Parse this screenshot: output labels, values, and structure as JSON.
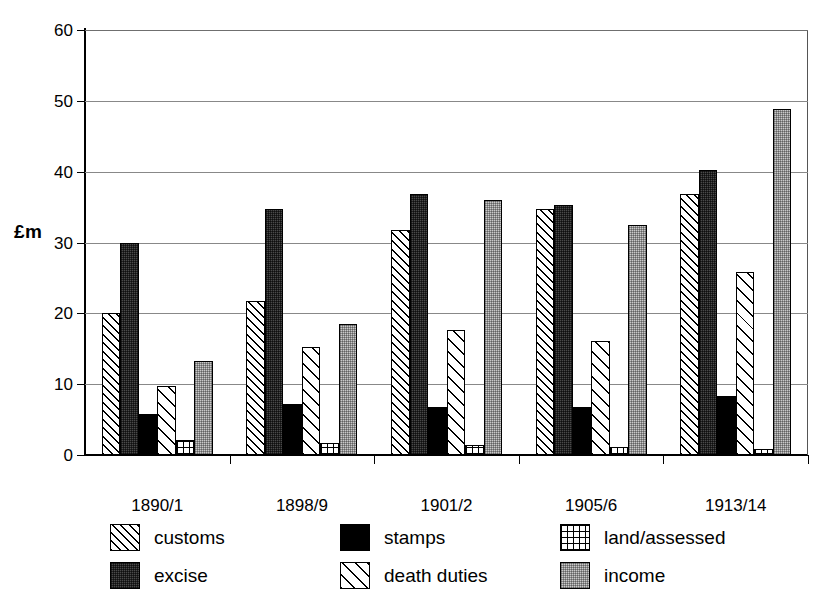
{
  "chart_data": {
    "type": "bar",
    "title": "",
    "xlabel": "",
    "ylabel": "£m",
    "ylim": [
      0,
      60
    ],
    "yticks": [
      0,
      10,
      20,
      30,
      40,
      50,
      60
    ],
    "grid": true,
    "legend_position": "bottom",
    "categories": [
      "1890/1",
      "1898/9",
      "1901/2",
      "1905/6",
      "1913/14"
    ],
    "series": [
      {
        "name": "customs",
        "pattern": "diagonal-hatch-dense",
        "values": [
          20.1,
          21.8,
          31.7,
          34.8,
          36.9
        ]
      },
      {
        "name": "excise",
        "pattern": "dark-checker",
        "values": [
          29.9,
          34.8,
          36.8,
          35.3,
          40.2
        ]
      },
      {
        "name": "stamps",
        "pattern": "solid-black",
        "values": [
          5.8,
          7.2,
          6.8,
          6.8,
          8.3
        ]
      },
      {
        "name": "death duties",
        "pattern": "diagonal-hatch-wide",
        "values": [
          9.8,
          15.3,
          17.7,
          16.1,
          25.9
        ]
      },
      {
        "name": "land/assessed",
        "pattern": "dotted-grid",
        "values": [
          2.1,
          1.7,
          1.4,
          1.1,
          0.8
        ]
      },
      {
        "name": "income",
        "pattern": "light-checker",
        "values": [
          13.3,
          18.5,
          36.0,
          32.5,
          48.8
        ]
      }
    ]
  },
  "axis": {
    "y_title": "£m",
    "y_tick_labels": [
      "0",
      "10",
      "20",
      "30",
      "40",
      "50",
      "60"
    ],
    "x_tick_labels": [
      "1890/1",
      "1898/9",
      "1901/2",
      "1905/6",
      "1913/14"
    ]
  },
  "legend": {
    "entries": [
      {
        "label": "customs",
        "pattern": "diagonal-hatch-dense"
      },
      {
        "label": "stamps",
        "pattern": "solid-black"
      },
      {
        "label": "land/assessed",
        "pattern": "dotted-grid"
      },
      {
        "label": "excise",
        "pattern": "dark-checker"
      },
      {
        "label": "death duties",
        "pattern": "diagonal-hatch-wide"
      },
      {
        "label": "income",
        "pattern": "light-checker"
      }
    ]
  },
  "colors": {
    "axis": "#000000",
    "gridline": "#888888",
    "excise_fill": "#4a4a4a",
    "income_fill": "#c9c9c9",
    "stamps_fill": "#000000",
    "background": "#ffffff"
  }
}
